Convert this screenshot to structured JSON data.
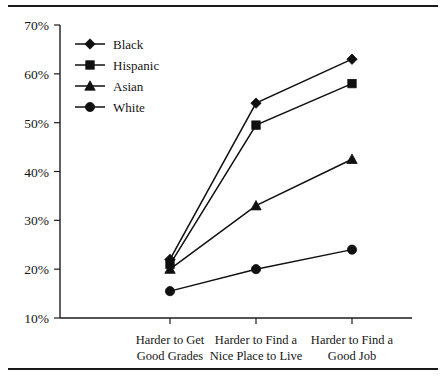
{
  "figure": {
    "top_rule": "",
    "bottom_rule": "",
    "cut_title": ""
  },
  "chart_data": {
    "type": "line",
    "title": "",
    "xlabel": "",
    "ylabel": "",
    "categories": [
      "Harder to Get Good Grades",
      "Harder to Find a Nice Place to Live",
      "Harder to Find a Good Job"
    ],
    "category_lines": [
      [
        "Harder to Get",
        "Good Grades"
      ],
      [
        "Harder to Find a",
        "Nice Place to Live"
      ],
      [
        "Harder to Find a",
        "Good Job"
      ]
    ],
    "series": [
      {
        "name": "Black",
        "marker": "diamond",
        "values": [
          22,
          54,
          63
        ]
      },
      {
        "name": "Hispanic",
        "marker": "square",
        "values": [
          21,
          49.5,
          58
        ]
      },
      {
        "name": "Asian",
        "marker": "triangle",
        "values": [
          20,
          33,
          42.5
        ]
      },
      {
        "name": "White",
        "marker": "circle",
        "values": [
          15.5,
          20,
          24
        ]
      }
    ],
    "ylim": [
      10,
      70
    ],
    "ytick_values": [
      10,
      20,
      30,
      40,
      50,
      60,
      70
    ],
    "ytick_labels": [
      "10%",
      "20%",
      "30%",
      "40%",
      "50%",
      "60%",
      "70%"
    ],
    "grid": false,
    "legend_position": "top-left-inside",
    "legend_entries": [
      "Black",
      "Hispanic",
      "Asian",
      "White"
    ],
    "line_color": "#101010"
  }
}
